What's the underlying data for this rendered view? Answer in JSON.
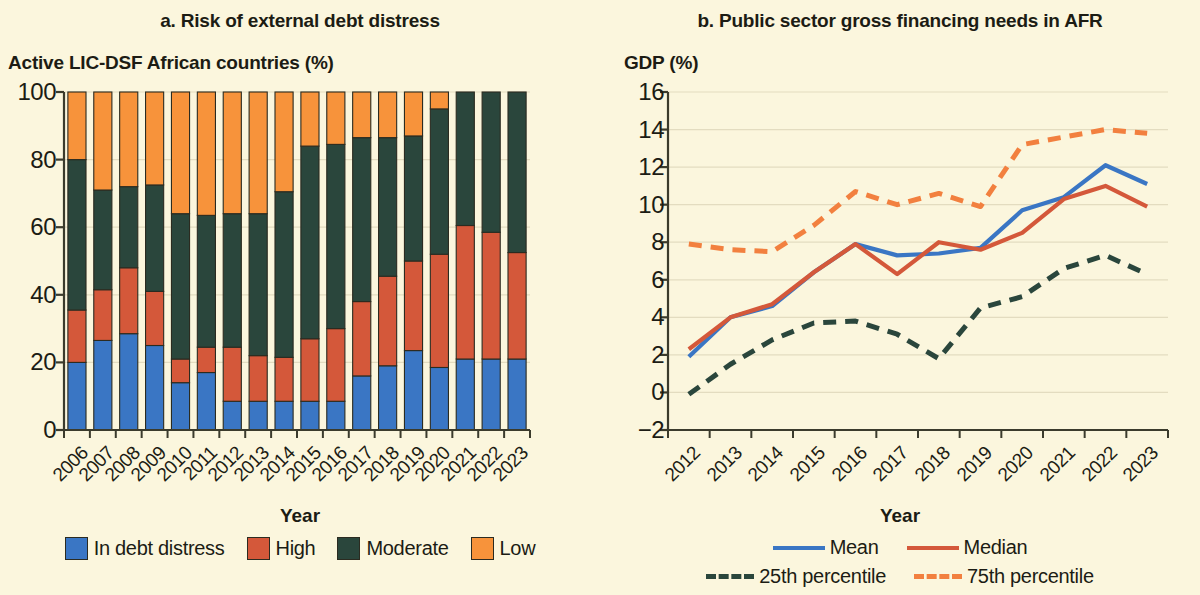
{
  "palette": {
    "background": "#fbf6dd",
    "blue": "#3a76c4",
    "red": "#d4583a",
    "green": "#2a463c",
    "orange": "#f7933b",
    "orange_dashed": "#f2803f",
    "axis": "#3b3b2c",
    "grid": "#e3dcc0"
  },
  "panel_a": {
    "title": "a. Risk of external debt distress",
    "y_axis_label": "Active LIC-DSF African countries (%)",
    "x_axis_label": "Year",
    "legend": [
      {
        "label": "In debt distress",
        "color": "#3a76c4",
        "key": "in_debt_distress"
      },
      {
        "label": "High",
        "color": "#d4583a",
        "key": "high"
      },
      {
        "label": "Moderate",
        "color": "#2a463c",
        "key": "moderate"
      },
      {
        "label": "Low",
        "color": "#f7933b",
        "key": "low"
      }
    ]
  },
  "panel_b": {
    "title": "b. Public sector gross financing needs in AFR",
    "y_axis_label": "GDP (%)",
    "x_axis_label": "Year",
    "legend": [
      {
        "label": "Mean",
        "color": "#3a76c4",
        "style": "solid"
      },
      {
        "label": "Median",
        "color": "#d4583a",
        "style": "solid"
      },
      {
        "label": "25th percentile",
        "color": "#2a463c",
        "style": "dashed"
      },
      {
        "label": "75th percentile",
        "color": "#f2803f",
        "style": "dashed"
      }
    ]
  },
  "chart_data": [
    {
      "type": "bar",
      "stacked": true,
      "title": "a. Risk of external debt distress",
      "xlabel": "Year",
      "ylabel": "Active LIC-DSF African countries (%)",
      "ylim": [
        0,
        100
      ],
      "yticks": [
        0,
        20,
        40,
        60,
        80,
        100
      ],
      "grid": true,
      "legend_position": "bottom",
      "categories": [
        "2006",
        "2007",
        "2008",
        "2009",
        "2010",
        "2011",
        "2012",
        "2013",
        "2014",
        "2015",
        "2016",
        "2017",
        "2018",
        "2019",
        "2020",
        "2021",
        "2022",
        "2023"
      ],
      "series": [
        {
          "name": "In debt distress",
          "color": "#3a76c4",
          "values": [
            20,
            26.5,
            28.5,
            25,
            14,
            17,
            8.5,
            8.5,
            8.5,
            8.5,
            8.5,
            16,
            19,
            23.5,
            18.5,
            21,
            21,
            21
          ]
        },
        {
          "name": "High",
          "color": "#d4583a",
          "values": [
            15.5,
            15,
            19.5,
            16,
            7,
            7.5,
            16,
            13.5,
            13,
            18.5,
            21.5,
            22,
            26.5,
            26.5,
            33.5,
            39.5,
            37.5,
            31.5
          ]
        },
        {
          "name": "Moderate",
          "color": "#2a463c",
          "values": [
            44.5,
            29.5,
            24,
            31.5,
            43,
            39,
            39.5,
            42,
            49,
            57,
            54.5,
            48.5,
            41,
            37,
            43,
            39.5,
            41.5,
            47.5
          ]
        },
        {
          "name": "Low",
          "color": "#f7933b",
          "values": [
            20,
            29,
            28,
            27.5,
            36,
            36.5,
            36,
            36,
            29.5,
            16,
            15.5,
            13.5,
            13.5,
            13,
            5,
            0,
            0,
            0
          ]
        }
      ]
    },
    {
      "type": "line",
      "title": "b. Public sector gross financing needs in AFR",
      "xlabel": "Year",
      "ylabel": "GDP (%)",
      "ylim": [
        -2,
        16
      ],
      "yticks": [
        -2,
        0,
        2,
        4,
        6,
        8,
        10,
        12,
        14,
        16
      ],
      "grid": true,
      "legend_position": "bottom",
      "x": [
        "2012",
        "2013",
        "2014",
        "2015",
        "2016",
        "2017",
        "2018",
        "2019",
        "2020",
        "2021",
        "2022",
        "2023"
      ],
      "series": [
        {
          "name": "Mean",
          "color": "#3a76c4",
          "style": "solid",
          "values": [
            1.9,
            4.0,
            4.6,
            6.4,
            7.9,
            7.3,
            7.4,
            7.7,
            9.7,
            10.4,
            12.1,
            11.1
          ]
        },
        {
          "name": "Median",
          "color": "#d4583a",
          "style": "solid",
          "values": [
            2.3,
            4.0,
            4.7,
            6.4,
            7.9,
            6.3,
            8.0,
            7.6,
            8.5,
            10.3,
            11.0,
            9.9
          ]
        },
        {
          "name": "25th percentile",
          "color": "#2a463c",
          "style": "dashed",
          "values": [
            -0.1,
            1.5,
            2.8,
            3.7,
            3.8,
            3.1,
            1.8,
            4.5,
            5.1,
            6.6,
            7.3,
            6.3
          ]
        },
        {
          "name": "75th percentile",
          "color": "#f2803f",
          "style": "dashed",
          "values": [
            7.9,
            7.6,
            7.5,
            8.9,
            10.7,
            10.0,
            10.6,
            9.9,
            13.2,
            13.6,
            14.0,
            13.8
          ]
        }
      ]
    }
  ]
}
